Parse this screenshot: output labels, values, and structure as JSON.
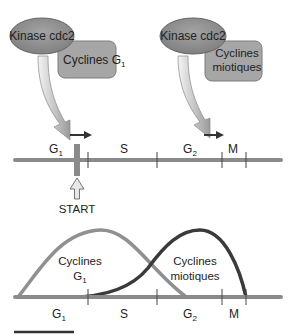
{
  "complexes": [
    {
      "kinase_label": "Kinase cdc2",
      "cyclin_label_line1": "Cyclines G",
      "cyclin_label_sub": "1",
      "cyclin_label_line2": ""
    },
    {
      "kinase_label": "Kinase cdc2",
      "cyclin_label_line1": "Cyclines",
      "cyclin_label_sub": "",
      "cyclin_label_line2": "miotiques"
    }
  ],
  "timeline_top": {
    "phases": [
      {
        "label": "G",
        "sub": "1"
      },
      {
        "label": "S",
        "sub": ""
      },
      {
        "label": "G",
        "sub": "2"
      },
      {
        "label": "M",
        "sub": ""
      }
    ],
    "start_label": "START"
  },
  "timeline_bottom": {
    "phases": [
      {
        "label": "G",
        "sub": "1"
      },
      {
        "label": "S",
        "sub": ""
      },
      {
        "label": "G",
        "sub": "2"
      },
      {
        "label": "M",
        "sub": ""
      }
    ],
    "curve_g1_label_line1": "Cyclines",
    "curve_g1_label_line2": "G",
    "curve_g1_label_sub": "1",
    "curve_mitotic_label_line1": "Cyclines",
    "curve_mitotic_label_line2": "miotiques"
  },
  "colors": {
    "ellipse_fill": "#8f8f8f",
    "box_fill": "#a8a8a8",
    "timeline": "#8a8a8a",
    "g1_curve": "#909090",
    "mitotic_curve": "#3a3a3a",
    "start_bar": "#8a8a8a",
    "arrow_dark": "#333333"
  }
}
